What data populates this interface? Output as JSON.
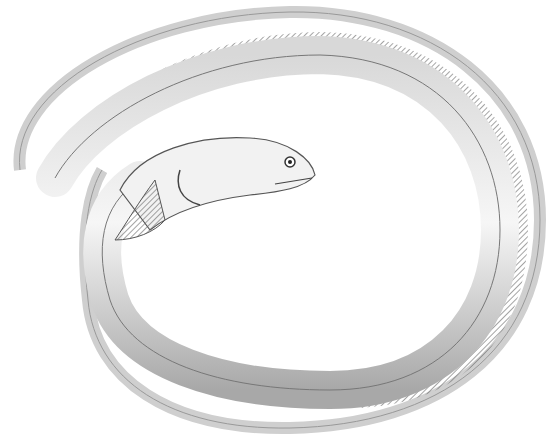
{
  "image": {
    "subject": "coiled eel engraving",
    "background": "#ffffff",
    "colors": {
      "line": "#555555",
      "shade": "#bdbdbd",
      "light": "#e8e8e8",
      "dark": "#333333"
    }
  }
}
